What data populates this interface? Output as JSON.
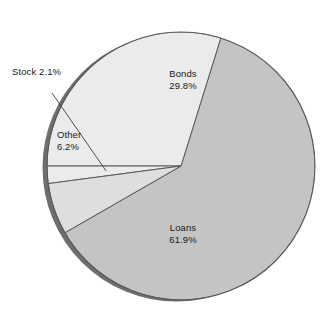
{
  "chart_data": {
    "type": "pie",
    "title": "",
    "subtitle": "",
    "xlabel": "",
    "ylabel": "",
    "legend_position": "none",
    "grid": false,
    "value_unit": "%",
    "total": 100.0,
    "categories": [
      "Bonds",
      "Loans",
      "Other",
      "Stock"
    ],
    "values": [
      29.8,
      61.9,
      6.2,
      2.1
    ],
    "slices": [
      {
        "name": "Bonds",
        "value": 29.8,
        "label": "Bonds",
        "value_label": "29.8%",
        "color": "#ebebeb",
        "label_placement": "inside"
      },
      {
        "name": "Loans",
        "value": 61.9,
        "label": "Loans",
        "value_label": "61.9%",
        "color": "#c4c4c4",
        "label_placement": "inside"
      },
      {
        "name": "Other",
        "value": 6.2,
        "label": "Other",
        "value_label": "6.2%",
        "color": "#dedede",
        "label_placement": "inside"
      },
      {
        "name": "Stock",
        "value": 2.1,
        "label": "Stock",
        "value_label": "2.1%",
        "color": "#ebebeb",
        "label_placement": "callout"
      }
    ],
    "style": {
      "outline_color": "#555555",
      "shadow_color": "#6e6e6e",
      "background": "#ffffff",
      "leader_line_color": "#3c3c3c"
    }
  }
}
